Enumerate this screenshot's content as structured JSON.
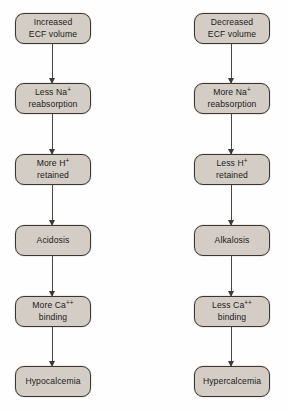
{
  "diagram": {
    "background_color": "#fefefe",
    "node_fill_color": "#d3cdc6",
    "node_border_color": "#3a3632",
    "arrow_color": "#4a4642",
    "columns": [
      {
        "id": "increased-ecf-volume-pathway",
        "name": "left-pathway",
        "nodes": [
          {
            "id": "increased-ecf-volume",
            "line1": "Increased",
            "line2": "ECF volume",
            "sup": ""
          },
          {
            "id": "less-na-reabsorption",
            "line1": "Less Na",
            "line2": "reabsorption",
            "sup": "+"
          },
          {
            "id": "more-h-retained",
            "line1": "More H",
            "line2": "retained",
            "sup": "+"
          },
          {
            "id": "acidosis",
            "line1": "Acidosis",
            "line2": "",
            "sup": ""
          },
          {
            "id": "more-ca-binding",
            "line1": "More Ca",
            "line2": "binding",
            "sup": "++"
          },
          {
            "id": "hypocalcemia",
            "line1": "Hypocalcemia",
            "line2": "",
            "sup": ""
          }
        ]
      },
      {
        "id": "decreased-ecf-volume-pathway",
        "name": "right-pathway",
        "nodes": [
          {
            "id": "decreased-ecf-volume",
            "line1": "Decreased",
            "line2": "ECF volume",
            "sup": ""
          },
          {
            "id": "more-na-reabsorption",
            "line1": "More Na",
            "line2": "reabsorption",
            "sup": "+"
          },
          {
            "id": "less-h-retained",
            "line1": "Less H",
            "line2": "retained",
            "sup": "+"
          },
          {
            "id": "alkalosis",
            "line1": "Alkalosis",
            "line2": "",
            "sup": ""
          },
          {
            "id": "less-ca-binding",
            "line1": "Less Ca",
            "line2": "binding",
            "sup": "++"
          },
          {
            "id": "hypercalcemia",
            "line1": "Hypercalcemia",
            "line2": "",
            "sup": ""
          }
        ]
      }
    ]
  }
}
